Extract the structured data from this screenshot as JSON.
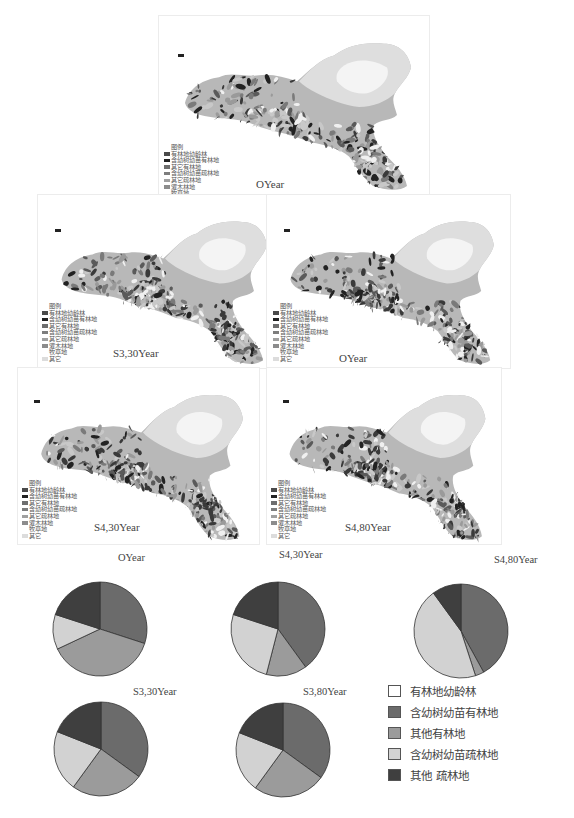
{
  "maps": {
    "legend_title": "图例",
    "legend_items": [
      {
        "label": "有林地幼龄林",
        "color": "#4a4a4a"
      },
      {
        "label": "含幼树幼苗有林地",
        "color": "#222222"
      },
      {
        "label": "其它有林地",
        "color": "#6e6e6e"
      },
      {
        "label": "含幼树幼苗疏林地",
        "color": "#7d7d7d"
      },
      {
        "label": "其它疏林地",
        "color": "#a0a0a0"
      },
      {
        "label": "灌木林地",
        "color": "#8c8c8c"
      },
      {
        "label": "牧草地",
        "color": "#ffffff"
      },
      {
        "label": "其它",
        "color": "#dcdcdc"
      }
    ],
    "panels": [
      {
        "label": "OYear"
      },
      {
        "label": "S3,30Year"
      },
      {
        "label": "OYear"
      },
      {
        "label": "S4,30Year"
      },
      {
        "label": "S4,80Year"
      }
    ],
    "captions": [
      "OYear",
      "S4,30Year",
      "S4,80Year"
    ]
  },
  "pie_captions": [
    "S3,30Year",
    "S3,80Year"
  ],
  "pie_legend": [
    {
      "label": "有林地幼龄林",
      "color": "#ffffff"
    },
    {
      "label": "含幼树幼苗有林地",
      "color": "#6b6b6b"
    },
    {
      "label": "其他有林地",
      "color": "#9b9b9b"
    },
    {
      "label": "含幼树幼苗疏林地",
      "color": "#d2d2d2"
    },
    {
      "label": "其他 疏林地",
      "color": "#3f3f3f"
    }
  ],
  "chart_data": {
    "type": "pie",
    "title": "",
    "categories": [
      "有林地幼龄林",
      "含幼树幼苗有林地",
      "其他有林地",
      "含幼树幼苗疏林地",
      "其他疏林地"
    ],
    "colors": [
      "#ffffff",
      "#6b6b6b",
      "#9b9b9b",
      "#d2d2d2",
      "#3f3f3f"
    ],
    "series": [
      {
        "name": "OYear",
        "values": [
          0,
          30,
          38,
          12,
          20
        ]
      },
      {
        "name": "S3,30Year",
        "values": [
          0,
          40,
          14,
          26,
          20
        ]
      },
      {
        "name": "S3,80Year",
        "values": [
          0,
          42,
          3,
          45,
          10
        ]
      },
      {
        "name": "S4,30Year",
        "values": [
          0,
          35,
          25,
          21,
          19
        ]
      },
      {
        "name": "S4,80Year",
        "values": [
          0,
          35,
          25,
          21,
          19
        ]
      }
    ],
    "legend_position": "right"
  }
}
